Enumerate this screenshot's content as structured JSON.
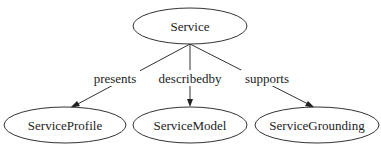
{
  "diagram": {
    "type": "directed-graph",
    "nodes": [
      {
        "id": "service",
        "label": "Service"
      },
      {
        "id": "profile",
        "label": "ServiceProfile"
      },
      {
        "id": "model",
        "label": "ServiceModel"
      },
      {
        "id": "grounding",
        "label": "ServiceGrounding"
      }
    ],
    "edges": [
      {
        "from": "service",
        "to": "profile",
        "label": "presents"
      },
      {
        "from": "service",
        "to": "model",
        "label": "describedby"
      },
      {
        "from": "service",
        "to": "grounding",
        "label": "supports"
      }
    ]
  }
}
